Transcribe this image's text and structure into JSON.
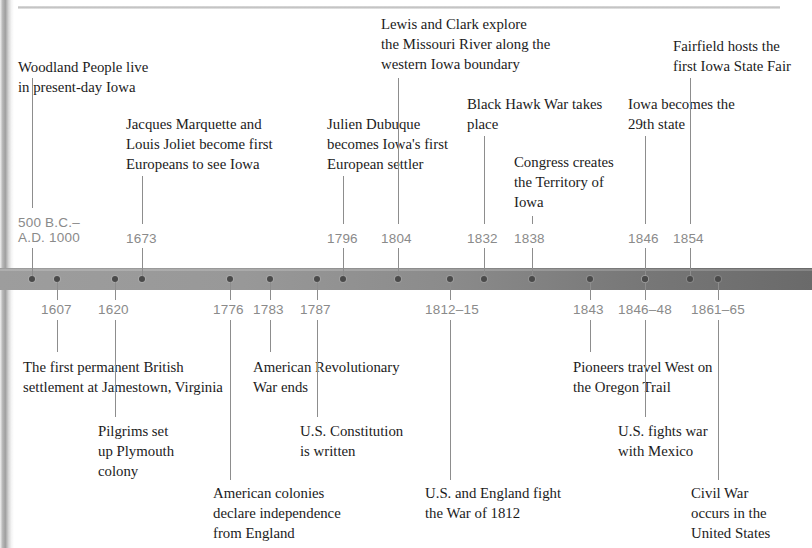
{
  "document": {
    "type": "historical-timeline",
    "subject": "Iowa and United States history"
  },
  "timeline": {
    "bar_color_left": "#9d9d9d",
    "bar_color_right": "#6a6a6a",
    "dot_color": "#4a4a4a",
    "date_color": "#8a8a8a",
    "text_color": "#1b1b1b"
  },
  "events_above": [
    {
      "date": "500 B.C.–\nA.D. 1000",
      "text": "Woodland People live\nin present-day Iowa",
      "dot_x": 32,
      "date_x": 18,
      "date_y": 215,
      "tick_x": 32,
      "tick_top": 248,
      "tick_height": 28,
      "lead_top": 78,
      "lead_height": 130,
      "desc_x": 18,
      "desc_y": 57
    },
    {
      "date": "1673",
      "text": "Jacques Marquette and\nLouis Joliet become first\nEuropeans to see Iowa",
      "dot_x": 142,
      "date_x": 126,
      "date_y": 231,
      "tick_x": 142,
      "tick_top": 248,
      "tick_height": 28,
      "lead_top": 176,
      "lead_height": 48,
      "desc_x": 126,
      "desc_y": 114
    },
    {
      "date": "1796",
      "text": "Julien Dubuque\nbecomes Iowa's first\nEuropean settler",
      "dot_x": 343,
      "date_x": 327,
      "date_y": 231,
      "tick_x": 343,
      "tick_top": 248,
      "tick_height": 28,
      "lead_top": 176,
      "lead_height": 48,
      "desc_x": 327,
      "desc_y": 114
    },
    {
      "date": "1804",
      "text": "Lewis and Clark explore\nthe Missouri River along the\nwestern Iowa boundary",
      "dot_x": 398,
      "date_x": 381,
      "date_y": 231,
      "tick_x": 398,
      "tick_top": 248,
      "tick_height": 28,
      "lead_top": 78,
      "lead_height": 146,
      "desc_x": 381,
      "desc_y": 14
    },
    {
      "date": "1832",
      "text": "Black Hawk War takes\nplace",
      "dot_x": 484,
      "date_x": 467,
      "date_y": 231,
      "tick_x": 484,
      "tick_top": 248,
      "tick_height": 28,
      "lead_top": 136,
      "lead_height": 88,
      "desc_x": 467,
      "desc_y": 94
    },
    {
      "date": "1838",
      "text": "Congress creates\nthe Territory of\nIowa",
      "dot_x": 532,
      "date_x": 514,
      "date_y": 231,
      "tick_x": 532,
      "tick_top": 248,
      "tick_height": 28,
      "lead_top": 216,
      "lead_height": 8,
      "desc_x": 514,
      "desc_y": 152
    },
    {
      "date": "1846",
      "text": "Iowa becomes the\n29th state",
      "dot_x": 645,
      "date_x": 628,
      "date_y": 231,
      "tick_x": 645,
      "tick_top": 248,
      "tick_height": 28,
      "lead_top": 136,
      "lead_height": 88,
      "desc_x": 628,
      "desc_y": 94
    },
    {
      "date": "1854",
      "text": "Fairfield hosts the\nfirst Iowa State Fair",
      "dot_x": 690,
      "date_x": 673,
      "date_y": 231,
      "tick_x": 690,
      "tick_top": 248,
      "tick_height": 28,
      "lead_top": 78,
      "lead_height": 146,
      "desc_x": 673,
      "desc_y": 36
    }
  ],
  "events_below": [
    {
      "date": "1607",
      "text": "The first permanent British\nsettlement at Jamestown, Virginia",
      "dot_x": 57,
      "date_x": 41,
      "date_y": 302,
      "tick_x": 57,
      "tick_top": 282,
      "tick_height": 18,
      "lead_top": 320,
      "lead_height": 32,
      "desc_x": 23,
      "desc_y": 357
    },
    {
      "date": "1620",
      "text": "Pilgrims set\nup Plymouth\ncolony",
      "dot_x": 115,
      "date_x": 98,
      "date_y": 302,
      "tick_x": 115,
      "tick_top": 282,
      "tick_height": 18,
      "lead_top": 320,
      "lead_height": 97,
      "desc_x": 98,
      "desc_y": 421
    },
    {
      "date": "1776",
      "text": "American colonies\ndeclare independence\nfrom England",
      "dot_x": 230,
      "date_x": 213,
      "date_y": 302,
      "tick_x": 230,
      "tick_top": 282,
      "tick_height": 18,
      "lead_top": 320,
      "lead_height": 160,
      "desc_x": 213,
      "desc_y": 483
    },
    {
      "date": "1783",
      "text": "American Revolutionary\nWar ends",
      "dot_x": 270,
      "date_x": 253,
      "date_y": 302,
      "tick_x": 270,
      "tick_top": 282,
      "tick_height": 18,
      "lead_top": 320,
      "lead_height": 32,
      "desc_x": 253,
      "desc_y": 357
    },
    {
      "date": "1787",
      "text": "U.S. Constitution\nis written",
      "dot_x": 317,
      "date_x": 300,
      "date_y": 302,
      "tick_x": 317,
      "tick_top": 282,
      "tick_height": 18,
      "lead_top": 320,
      "lead_height": 97,
      "desc_x": 300,
      "desc_y": 421
    },
    {
      "date": "1812–15",
      "text": "U.S. and England fight\nthe War of 1812",
      "dot_x": 450,
      "date_x": 425,
      "date_y": 302,
      "tick_x": 450,
      "tick_top": 282,
      "tick_height": 18,
      "lead_top": 320,
      "lead_height": 160,
      "desc_x": 425,
      "desc_y": 483
    },
    {
      "date": "1843",
      "text": "Pioneers travel West on\nthe Oregon Trail",
      "dot_x": 590,
      "date_x": 573,
      "date_y": 302,
      "tick_x": 590,
      "tick_top": 282,
      "tick_height": 18,
      "lead_top": 320,
      "lead_height": 32,
      "desc_x": 573,
      "desc_y": 357
    },
    {
      "date": "1846–48",
      "text": "U.S. fights war\nwith Mexico",
      "dot_x": 645,
      "date_x": 618,
      "date_y": 302,
      "tick_x": 645,
      "tick_top": 282,
      "tick_height": 18,
      "lead_top": 320,
      "lead_height": 97,
      "desc_x": 618,
      "desc_y": 421
    },
    {
      "date": "1861–65",
      "text": "Civil War\noccurs in the\nUnited States",
      "dot_x": 718,
      "date_x": 691,
      "date_y": 302,
      "tick_x": 718,
      "tick_top": 282,
      "tick_height": 18,
      "lead_top": 320,
      "lead_height": 160,
      "desc_x": 691,
      "desc_y": 483
    }
  ]
}
